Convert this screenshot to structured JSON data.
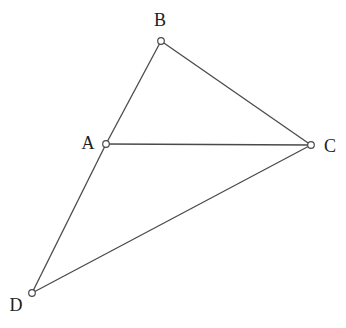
{
  "diagram": {
    "type": "geometry-figure",
    "stroke_color": "#4a4a4a",
    "point_fill": "#ffffff",
    "points": [
      {
        "id": "B",
        "label": "B",
        "x": 161,
        "y": 41,
        "label_x": 160,
        "label_y": 20
      },
      {
        "id": "A",
        "label": "A",
        "x": 106,
        "y": 144,
        "label_x": 88,
        "label_y": 143
      },
      {
        "id": "C",
        "label": "C",
        "x": 311,
        "y": 145,
        "label_x": 330,
        "label_y": 146
      },
      {
        "id": "D",
        "label": "D",
        "x": 32,
        "y": 293,
        "label_x": 16,
        "label_y": 305
      }
    ],
    "segments": [
      [
        "B",
        "A"
      ],
      [
        "B",
        "C"
      ],
      [
        "A",
        "C"
      ],
      [
        "A",
        "D"
      ],
      [
        "D",
        "C"
      ]
    ]
  },
  "labels": {
    "A": "A",
    "B": "B",
    "C": "C",
    "D": "D"
  }
}
